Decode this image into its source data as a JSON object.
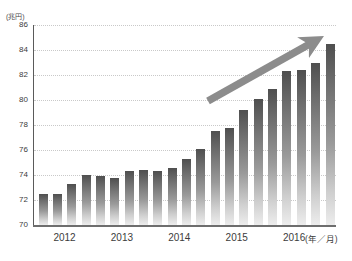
{
  "chart_data": {
    "type": "bar",
    "title": "",
    "subtitle": "",
    "xlabel": "(年／月)",
    "ylabel": "(兆円)",
    "ylim": [
      70,
      86
    ],
    "y_ticks": [
      70,
      72,
      74,
      76,
      78,
      80,
      82,
      84,
      86
    ],
    "y_tick_labels": [
      "70",
      "72",
      "74",
      "76",
      "78",
      "80",
      "82",
      "84",
      "86"
    ],
    "grid": "horizontal-dotted",
    "legend": "none",
    "x_group_labels": [
      "2012",
      "2013",
      "2014",
      "2015",
      "2016"
    ],
    "categories": [
      "2012-1",
      "2012-2",
      "2012-3",
      "2012-4",
      "2013-1",
      "2013-2",
      "2013-3",
      "2013-4",
      "2014-1",
      "2014-2",
      "2014-3",
      "2014-4",
      "2015-1",
      "2015-2",
      "2015-3",
      "2015-4",
      "2016-1",
      "2016-2",
      "2016-3",
      "2016-4",
      "2016-5"
    ],
    "values": [
      72.5,
      72.5,
      73.3,
      74.0,
      73.9,
      73.8,
      74.3,
      74.4,
      74.3,
      74.6,
      75.3,
      76.1,
      77.5,
      77.8,
      79.2,
      80.1,
      80.9,
      82.3,
      82.4,
      83.0,
      84.5
    ],
    "bar_colors": {
      "top": "#4f4f4f",
      "bottom": "#ededed"
    },
    "annotations": [
      {
        "name": "upward-trend-arrow",
        "type": "arrow",
        "color": "#8c8c8c",
        "from": {
          "x": 208,
          "y": 101
        },
        "to": {
          "x": 322,
          "y": 37
        }
      }
    ]
  },
  "axis": {
    "y_unit_caption": "(兆円)",
    "x_unit_caption": "(年／月)"
  }
}
